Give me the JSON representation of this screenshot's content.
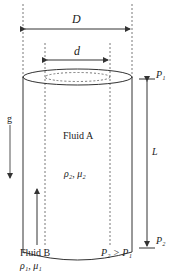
{
  "diagram": {
    "labels": {
      "outer_diameter": "D",
      "inner_diameter": "d",
      "top_pressure": "P₁",
      "bottom_pressure": "P₂",
      "length": "L",
      "gravity": "g",
      "fluid_a_name": "Fluid A",
      "fluid_a_props": "ρ₂, μ₂",
      "fluid_b_name": "Fluid B",
      "fluid_b_props": "ρ₁, μ₁",
      "pressure_relation": "P₂ > P₁"
    },
    "colors": {
      "line": "#333333",
      "dashed": "#555555",
      "background": "#ffffff"
    }
  }
}
